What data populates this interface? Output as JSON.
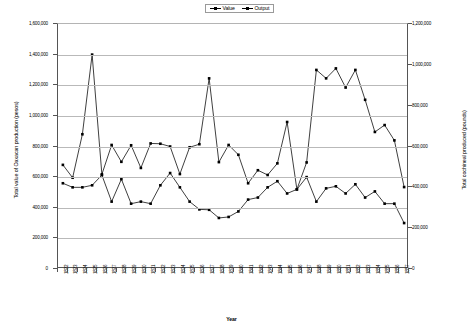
{
  "chart_data": {
    "type": "line",
    "title": "",
    "xlabel": "Year",
    "ylabel": "Total value of Oaxacan production (pesos)",
    "y2label": "Total cochineal produced (pounds)",
    "ylim": [
      0,
      1600000
    ],
    "y2lim": [
      0,
      1200000
    ],
    "yticks": [
      "0",
      "200,000",
      "400,000",
      "600,000",
      "800,000",
      "1,000,000",
      "1,200,000",
      "1,400,000",
      "1,600,000"
    ],
    "ytick_values": [
      0,
      200000,
      400000,
      600000,
      800000,
      1000000,
      1200000,
      1400000,
      1600000
    ],
    "y2ticks": [
      "0",
      "200,000",
      "400,000",
      "600,000",
      "800,000",
      "1,000,000",
      "1,200,000"
    ],
    "y2tick_values": [
      0,
      200000,
      400000,
      600000,
      800000,
      1000000,
      1200000
    ],
    "grid": true,
    "legend_position": "top-center",
    "legend": [
      "Value",
      "Output"
    ],
    "categories": [
      "1822",
      "1823",
      "1824",
      "1825",
      "1826",
      "1827",
      "1828",
      "1829",
      "1830",
      "1831",
      "1832",
      "1833",
      "1834",
      "1835",
      "1836",
      "1837",
      "1838",
      "1839",
      "1840",
      "1841",
      "1842",
      "1843",
      "1844",
      "1845",
      "1846",
      "1847",
      "1848",
      "1849",
      "1850",
      "1851",
      "1852",
      "1853",
      "1854",
      "1855",
      "1856",
      "1857"
    ],
    "series": [
      {
        "name": "Value",
        "axis": "left",
        "marker": "square",
        "color": "#000000",
        "values": [
          680000,
          596000,
          880000,
          1400000,
          618000,
          810000,
          700000,
          808000,
          660000,
          820000,
          818000,
          800000,
          620000,
          795000,
          815000,
          1245000,
          698000,
          810000,
          746000,
          560000,
          645000,
          614000,
          690000,
          960000,
          520000,
          696000,
          1300000,
          1245000,
          1310000,
          1185000,
          1300000,
          1105000,
          895000,
          940000,
          840000,
          535000
        ]
      },
      {
        "name": "Output",
        "axis": "right",
        "marker": "square",
        "color": "#000000",
        "values": [
          420000,
          400000,
          400000,
          410000,
          460000,
          330000,
          440000,
          320000,
          330000,
          320000,
          410000,
          470000,
          400000,
          330000,
          292000,
          290000,
          250000,
          255000,
          282000,
          340000,
          350000,
          400000,
          430000,
          370000,
          390000,
          450000,
          330000,
          395000,
          405000,
          370000,
          415000,
          350000,
          380000,
          320000,
          320000,
          225000
        ]
      }
    ]
  }
}
